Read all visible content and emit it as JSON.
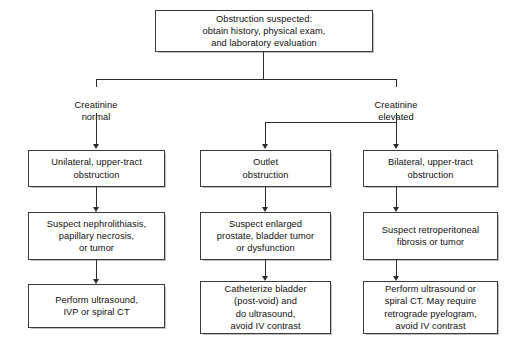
{
  "diagram": {
    "root": {
      "text": "Obstruction suspected:\nobtain history, physical exam,\nand laboratory evaluation"
    },
    "branch_labels": {
      "left": "Creatinine\nnormal",
      "right": "Creatinine\nelevated"
    },
    "columns": [
      {
        "id": "left",
        "diagnosis": "Unilateral, upper-tract\nobstruction",
        "suspect": "Suspect nephrolithiasis,\npapillary necrosis,\nor tumor",
        "action": "Perform ultrasound,\nIVP or spiral CT"
      },
      {
        "id": "middle",
        "diagnosis": "Outlet\nobstruction",
        "suspect": "Suspect enlarged\nprostate, bladder tumor\nor dysfunction",
        "action": "Catheterize bladder\n(post-void) and\ndo ultrasound,\navoid IV contrast"
      },
      {
        "id": "right",
        "diagnosis": "Bilateral, upper-tract\nobstruction",
        "suspect": "Suspect retroperitoneal\nfibrosis or tumor",
        "action": "Perform ultrasound or\nspiral CT.  May require\nretrograde pyelogram,\navoid IV contrast"
      }
    ],
    "colors": {
      "box_border": "#3a3a3a",
      "connector": "#2c2c2c",
      "background": "#ffffff",
      "text": "#111111"
    }
  }
}
